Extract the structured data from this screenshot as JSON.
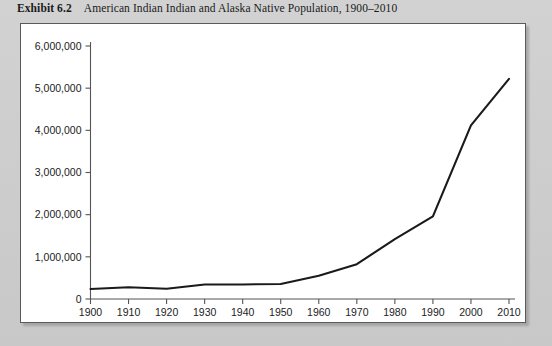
{
  "caption": {
    "exhibit_label": "Exhibit 6.2",
    "title": "American Indian Indian and Alaska Native Population, 1900–2010"
  },
  "colors": {
    "page_background": "#cdcdcd",
    "panel_background": "#ffffff",
    "panel_border": "#5a5a5a",
    "line": "#1a1a1a",
    "axis": "#555555",
    "text": "#1c1c1c"
  },
  "chart_data": {
    "type": "line",
    "title": "American Indian Indian and Alaska Native Population, 1900–2010",
    "xlabel": "",
    "ylabel": "",
    "grid": false,
    "legend": "none",
    "x": [
      1900,
      1910,
      1920,
      1930,
      1940,
      1950,
      1960,
      1970,
      1980,
      1990,
      2000,
      2010
    ],
    "x_tick_labels": [
      "1900",
      "1910",
      "1920",
      "1930",
      "1940",
      "1950",
      "1960",
      "1970",
      "1980",
      "1990",
      "2000",
      "2010"
    ],
    "y_tick_labels": [
      "0",
      "1,000,000",
      "2,000,000",
      "3,000,000",
      "4,000,000",
      "5,000,000",
      "6,000,000"
    ],
    "y_ticks": [
      0,
      1000000,
      2000000,
      3000000,
      4000000,
      5000000,
      6000000
    ],
    "xlim": [
      1900,
      2010
    ],
    "ylim": [
      0,
      6000000
    ],
    "series": [
      {
        "name": "American Indian and Alaska Native Population",
        "values": [
          237000,
          277000,
          244000,
          343000,
          345000,
          357000,
          552000,
          827000,
          1420000,
          1959000,
          4119000,
          5220000
        ]
      }
    ]
  }
}
